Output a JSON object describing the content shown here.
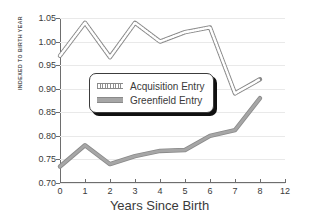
{
  "chart_data": {
    "type": "line",
    "title": "",
    "xlabel": "Years Since Birth",
    "ylabel": "INDEXED TO BIRTH YEAR",
    "x": [
      0,
      1,
      2,
      3,
      4,
      5,
      6,
      7,
      8
    ],
    "xlim": [
      0,
      9
    ],
    "ylim": [
      0.7,
      1.05
    ],
    "xticks": [
      "0",
      "1",
      "2",
      "3",
      "4",
      "5",
      "6",
      "7",
      "8",
      "12"
    ],
    "yticks": [
      "0.70",
      "0.75",
      "0.80",
      "0.85",
      "0.90",
      "0.95",
      "1.00",
      "1.05"
    ],
    "grid": true,
    "legend_position": "center-left-inside",
    "series": [
      {
        "name": "Acquisition Entry",
        "style": "dotted",
        "color": "#9a9a9a",
        "values": [
          0.97,
          1.04,
          0.967,
          1.04,
          1.0,
          1.02,
          1.03,
          0.89,
          0.92
        ]
      },
      {
        "name": "Greenfield Entry",
        "style": "solid",
        "color": "#a6a6a6",
        "values": [
          0.735,
          0.78,
          0.74,
          0.757,
          0.768,
          0.77,
          0.8,
          0.812,
          0.88
        ]
      }
    ]
  },
  "legend": {
    "items": [
      {
        "label": "Acquisition Entry",
        "swatch": "dotted-line-swatch"
      },
      {
        "label": "Greenfield Entry",
        "swatch": "solid-line-swatch"
      }
    ]
  }
}
